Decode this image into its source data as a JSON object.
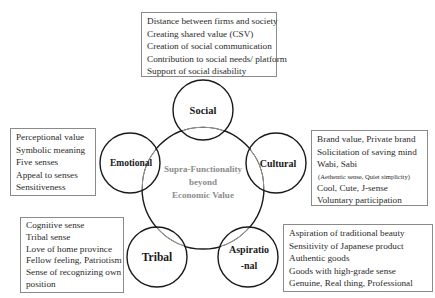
{
  "center": {
    "lines": [
      "Supra-Functionality",
      "beyond",
      "Economic Value"
    ]
  },
  "nodes": {
    "social": {
      "label": "Social"
    },
    "emotional": {
      "label": "Emotional"
    },
    "cultural": {
      "label": "Cultural"
    },
    "tribal": {
      "label": "Tribal"
    },
    "aspirational": {
      "label_line1": "Aspiratio",
      "label_line2": "-nal"
    }
  },
  "boxes": {
    "social": {
      "items": [
        "Distance between firms and society",
        "Creating shared value (CSV)",
        "Creation of social communication",
        "Contribution to social needs/ platform",
        "Support of social disability"
      ]
    },
    "emotional": {
      "items": [
        "Perceptional value",
        "Symbolic meaning",
        "Five senses",
        "Appeal to senses",
        "Sensitiveness"
      ]
    },
    "cultural": {
      "items": [
        "Brand value, Private brand",
        "Solicitation of saving mind",
        "Wabi, Sabi",
        "(Aethentic sense, Quiet simplicity)",
        "Cool, Cute, J-sense",
        "Voluntary participation"
      ]
    },
    "tribal": {
      "items": [
        "Cognitive sense",
        "Tribal sense",
        "Love of home province",
        "Fellow feeling, Patriotism",
        "Sense of recognizing own",
        "position"
      ]
    },
    "aspirational": {
      "items": [
        "Aspiration of traditional beauty",
        "Sensitivity of Japanese product",
        "Authentic goods",
        "Goods with high-grade sense",
        "Genuine, Real thing, Professional"
      ]
    }
  },
  "colors": {
    "circle_stroke": "#1a1a1a",
    "center_circle_overlap_stroke": "#9a9a9a",
    "center_text": "#8c8c8c",
    "box_border": "#8a8a8a"
  }
}
